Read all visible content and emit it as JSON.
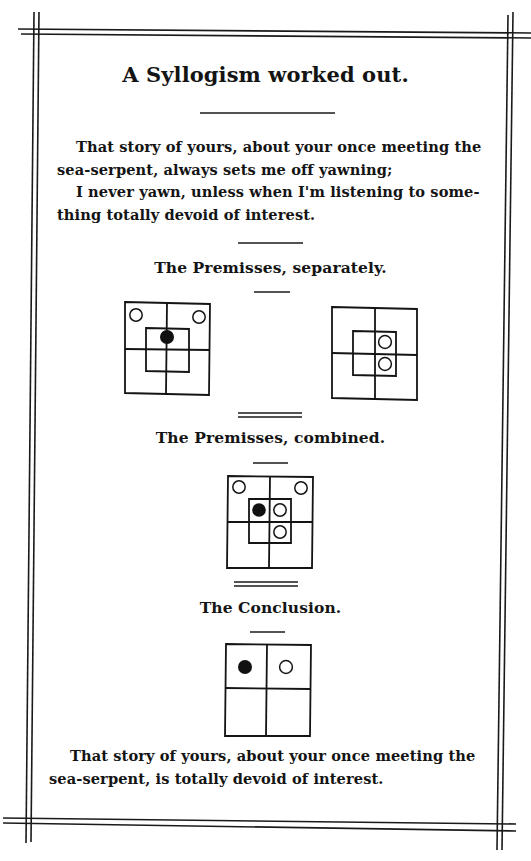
{
  "document": {
    "title": "A Syllogism worked out.",
    "premisses_text": {
      "lines": [
        "That story of yours, about your once meeting the",
        "sea-serpent, always sets me off yawning;",
        "I never yawn, unless when I'm listening to some-",
        "thing totally devoid of interest."
      ]
    },
    "sections": {
      "separately": {
        "heading": "The Premisses, separately."
      },
      "combined": {
        "heading": "The Premisses, combined."
      },
      "conclusion": {
        "heading": "The Conclusion."
      }
    },
    "conclusion_text": {
      "lines": [
        "That story of yours, about your once meeting the",
        "sea-serpent, is totally devoid of interest."
      ]
    },
    "diagrams": [
      {
        "name": "premiss-1-diagram",
        "type": "triliteral",
        "markers": [
          {
            "cell": "outer-top-left",
            "kind": "empty"
          },
          {
            "cell": "outer-top-right",
            "kind": "empty"
          },
          {
            "cell": "inner-top-center",
            "kind": "filled"
          }
        ]
      },
      {
        "name": "premiss-2-diagram",
        "type": "triliteral",
        "markers": [
          {
            "cell": "inner-top-right",
            "kind": "empty"
          },
          {
            "cell": "inner-bottom-right",
            "kind": "empty"
          }
        ]
      },
      {
        "name": "combined-diagram",
        "type": "triliteral",
        "markers": [
          {
            "cell": "outer-top-left",
            "kind": "empty"
          },
          {
            "cell": "outer-top-right",
            "kind": "empty"
          },
          {
            "cell": "inner-top-left",
            "kind": "filled"
          },
          {
            "cell": "inner-top-right",
            "kind": "empty"
          },
          {
            "cell": "inner-bottom-right",
            "kind": "empty"
          }
        ]
      },
      {
        "name": "conclusion-diagram",
        "type": "biliteral",
        "markers": [
          {
            "cell": "top-left",
            "kind": "filled"
          },
          {
            "cell": "top-right",
            "kind": "empty"
          }
        ]
      }
    ],
    "colors": {
      "ink": "#141414",
      "paper": "#ffffff"
    }
  }
}
